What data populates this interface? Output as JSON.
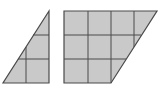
{
  "diagram": {
    "colors": {
      "fill": "#c9c9c9",
      "stroke": "#4a4a4a",
      "background": "#ffffff"
    },
    "unit_px": 23,
    "shapes": [
      {
        "name": "triangle",
        "points": "49,11 49,83 3,83",
        "grid_lines": [
          {
            "x1": 33,
            "y1": 35,
            "x2": 49,
            "y2": 35
          },
          {
            "x1": 18,
            "y1": 59,
            "x2": 49,
            "y2": 59
          },
          {
            "x1": 26,
            "y1": 47,
            "x2": 26,
            "y2": 83
          }
        ]
      },
      {
        "name": "quadrilateral",
        "points": "64,11 157,11 111,83 64,83",
        "grid_lines": [
          {
            "x1": 64,
            "y1": 35,
            "x2": 141,
            "y2": 35
          },
          {
            "x1": 64,
            "y1": 59,
            "x2": 126,
            "y2": 59
          },
          {
            "x1": 88,
            "y1": 11,
            "x2": 88,
            "y2": 83
          },
          {
            "x1": 111,
            "y1": 11,
            "x2": 111,
            "y2": 83
          },
          {
            "x1": 134,
            "y1": 11,
            "x2": 134,
            "y2": 47
          }
        ]
      }
    ]
  }
}
